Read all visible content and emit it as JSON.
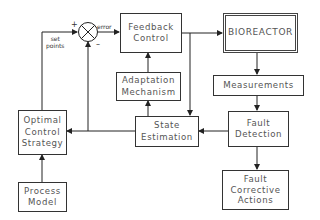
{
  "diagram": {
    "blocks": {
      "feedback_control": "Feedback\nControl",
      "bioreactor": "BIOREACTOR",
      "measurements": "Measurements",
      "adaptation_mechanism": "Adaptation\nMechanism",
      "state_estimation": "State\nEstimation",
      "fault_detection": "Fault\nDetection",
      "optimal_control_strategy": "Optimal\nControl\nStrategy",
      "process_model": "Process\nModel",
      "fault_corrective_actions": "Fault\nCorrective\nActions"
    },
    "labels": {
      "error": "error",
      "set_points": "set\npoints",
      "plus": "+",
      "minus": "–"
    },
    "colors": {
      "line": "#222222",
      "text": "#555555",
      "background": "#ffffff"
    }
  }
}
